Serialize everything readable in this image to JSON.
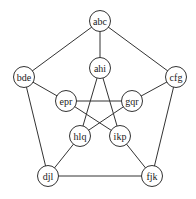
{
  "graph": {
    "type": "Petersen graph",
    "nodes": [
      {
        "id": "abc",
        "label": "abc",
        "x": 100,
        "y": 21
      },
      {
        "id": "ahi",
        "label": "ahi",
        "x": 100,
        "y": 68
      },
      {
        "id": "bde",
        "label": "bde",
        "x": 24,
        "y": 77
      },
      {
        "id": "cfg",
        "label": "cfg",
        "x": 176,
        "y": 77
      },
      {
        "id": "epr",
        "label": "epr",
        "x": 66,
        "y": 101
      },
      {
        "id": "gqr",
        "label": "gqr",
        "x": 132,
        "y": 101
      },
      {
        "id": "hlq",
        "label": "hlq",
        "x": 80,
        "y": 136
      },
      {
        "id": "ikp",
        "label": "ikp",
        "x": 120,
        "y": 136
      },
      {
        "id": "djl",
        "label": "djl",
        "x": 48,
        "y": 176
      },
      {
        "id": "fjk",
        "label": "fjk",
        "x": 152,
        "y": 176
      }
    ],
    "edges": [
      [
        "abc",
        "bde"
      ],
      [
        "abc",
        "cfg"
      ],
      [
        "bde",
        "djl"
      ],
      [
        "cfg",
        "fjk"
      ],
      [
        "djl",
        "fjk"
      ],
      [
        "abc",
        "ahi"
      ],
      [
        "bde",
        "epr"
      ],
      [
        "cfg",
        "gqr"
      ],
      [
        "djl",
        "hlq"
      ],
      [
        "fjk",
        "ikp"
      ],
      [
        "ahi",
        "hlq"
      ],
      [
        "ahi",
        "ikp"
      ],
      [
        "epr",
        "gqr"
      ],
      [
        "epr",
        "ikp"
      ],
      [
        "gqr",
        "hlq"
      ]
    ]
  }
}
